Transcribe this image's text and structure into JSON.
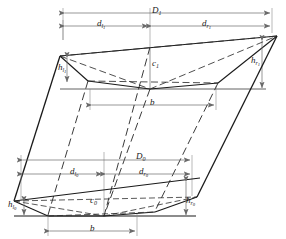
{
  "diagram": {
    "style": {
      "solid_line_color": "#1a1a1a",
      "dimension_line_color": "#6a6a6a",
      "dashed_line_color": "#4a4a4a",
      "background": "#ffffff"
    },
    "labels": {
      "upper_total_width": {
        "base": "D",
        "sub": "1",
        "name": "D1"
      },
      "upper_left_offset": {
        "base": "d",
        "sub": "l",
        "subsub": "1",
        "name": "d_l1"
      },
      "upper_right_offset": {
        "base": "d",
        "sub": "r",
        "subsub": "1",
        "name": "d_r1"
      },
      "upper_left_height": {
        "base": "h",
        "sub": "l",
        "subsub": "1",
        "name": "h_l1"
      },
      "upper_right_height": {
        "base": "h",
        "sub": "r",
        "subsub": "1",
        "name": "h_r1"
      },
      "upper_centre": {
        "base": "c",
        "sub": "1",
        "name": "c1"
      },
      "upper_base_width": {
        "base": "b",
        "sub": "",
        "name": "b_upper"
      },
      "lower_total_width": {
        "base": "D",
        "sub": "0",
        "name": "D0"
      },
      "lower_left_offset": {
        "base": "d",
        "sub": "l",
        "subsub": "0",
        "name": "d_l0"
      },
      "lower_right_offset": {
        "base": "d",
        "sub": "r",
        "subsub": "0",
        "name": "d_r0"
      },
      "lower_left_height": {
        "base": "h",
        "sub": "l",
        "subsub": "0",
        "name": "h_l0"
      },
      "lower_right_height": {
        "base": "h",
        "sub": "r",
        "subsub": "0",
        "name": "h_r0"
      },
      "lower_centre": {
        "base": "c",
        "sub": "0",
        "name": "c0"
      },
      "lower_base_width": {
        "base": "b",
        "sub": "",
        "name": "b_lower"
      }
    }
  }
}
